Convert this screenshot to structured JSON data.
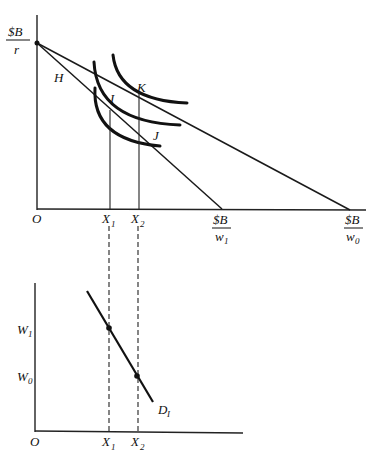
{
  "top_panel": {
    "origin_label": "O",
    "y_intercept": {
      "num": "$B",
      "den": "r"
    },
    "x_intercept_w1": {
      "num": "$B",
      "den": "w",
      "den_sub": "1"
    },
    "x_intercept_w0": {
      "num": "$B",
      "den": "w",
      "den_sub": "0"
    },
    "x_ticks": [
      {
        "main": "X",
        "sub": "1"
      },
      {
        "main": "X",
        "sub": "2"
      }
    ],
    "points": [
      "H",
      "I",
      "J",
      "K"
    ]
  },
  "bottom_panel": {
    "origin_label": "O",
    "y_ticks": [
      {
        "main": "W",
        "sub": "1"
      },
      {
        "main": "W",
        "sub": "0"
      }
    ],
    "x_ticks": [
      {
        "main": "X",
        "sub": "1"
      },
      {
        "main": "X",
        "sub": "2"
      }
    ],
    "curve_label": {
      "main": "D",
      "sub": "I"
    }
  }
}
